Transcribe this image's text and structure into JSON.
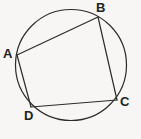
{
  "figure": {
    "background_color": "#f7f6f4",
    "stroke_color": "#2b2b2b",
    "label_color": "#232323",
    "canvas": {
      "width": 141,
      "height": 139
    }
  },
  "circle": {
    "name": "circumscribed-circle",
    "center_x": 71,
    "center_y": 65,
    "radius": 55.5,
    "stroke_width": 1.2
  },
  "vertices": [
    {
      "id": "A",
      "label": "A",
      "x": 17,
      "y": 55,
      "label_x": 3,
      "label_y": 47
    },
    {
      "id": "B",
      "label": "B",
      "x": 98,
      "y": 17,
      "label_x": 96,
      "label_y": 1
    },
    {
      "id": "C",
      "label": "C",
      "x": 117,
      "y": 100,
      "label_x": 120,
      "label_y": 95
    },
    {
      "id": "D",
      "label": "D",
      "x": 31,
      "y": 107,
      "label_x": 24,
      "label_y": 109
    }
  ],
  "edges": [
    {
      "id": "AB",
      "from": "A",
      "to": "B",
      "x1": 17,
      "y1": 55,
      "x2": 98,
      "y2": 17
    },
    {
      "id": "BC",
      "from": "B",
      "to": "C",
      "x1": 98,
      "y1": 17,
      "x2": 117,
      "y2": 100
    },
    {
      "id": "CD",
      "from": "C",
      "to": "D",
      "x1": 117,
      "y1": 100,
      "x2": 31,
      "y2": 107
    },
    {
      "id": "DA",
      "from": "D",
      "to": "A",
      "x1": 31,
      "y1": 107,
      "x2": 17,
      "y2": 55
    }
  ]
}
